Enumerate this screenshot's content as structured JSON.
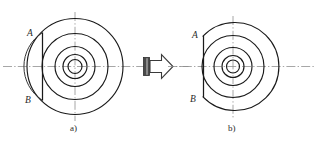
{
  "figure": {
    "background_color": "#ffffff",
    "line_color": "#1a1a1a",
    "centerline_color": "#8a8a8a",
    "width": 318,
    "height": 143,
    "captions": [
      {
        "id": "caption-a",
        "text": "a)",
        "x": 70,
        "y": 128
      },
      {
        "id": "caption-b",
        "text": "b)",
        "x": 228,
        "y": 128
      }
    ],
    "views": [
      {
        "id": "view-a",
        "caption": "a)",
        "center": {
          "x": 75,
          "y": 66
        },
        "point_labels": [
          {
            "name": "A",
            "x": 31,
            "y": 33
          },
          {
            "name": "B",
            "x": 29,
            "y": 100
          }
        ],
        "circles_radius": [
          48,
          33,
          20,
          12,
          7
        ],
        "chord_x": 42,
        "segment_present": true
      },
      {
        "id": "view-b",
        "caption": "b)",
        "center": {
          "x": 233,
          "y": 66
        },
        "point_labels": [
          {
            "name": "A",
            "x": 196,
            "y": 33
          },
          {
            "name": "B",
            "x": 194,
            "y": 100
          }
        ],
        "circles_radius": [
          44,
          31,
          19,
          11,
          6.5
        ],
        "chord_x": 203,
        "segment_present": false
      }
    ],
    "arrow": {
      "id": "transform-arrow",
      "direction": "right",
      "x": 143,
      "y": 55,
      "width": 30,
      "height": 23,
      "fill": "#ffffff",
      "tail_fill": "#4a4a4a"
    }
  }
}
